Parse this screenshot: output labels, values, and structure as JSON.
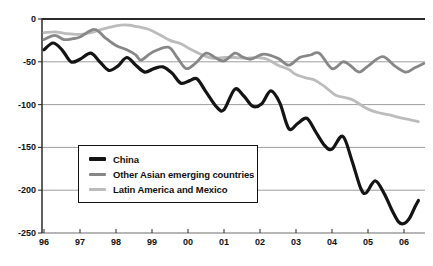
{
  "figure": {
    "background": "#ffffff"
  },
  "chart_data": {
    "type": "line",
    "title": "",
    "xlabel": "",
    "ylabel": "",
    "grid": "horizontal",
    "x_axis": {
      "tick_labels": [
        "96",
        "97",
        "98",
        "99",
        "00",
        "01",
        "02",
        "03",
        "04",
        "05",
        "06"
      ],
      "tick_values": [
        1996,
        1997,
        1998,
        1999,
        2000,
        2001,
        2002,
        2003,
        2004,
        2005,
        2006
      ],
      "range": [
        1996,
        2006.6
      ]
    },
    "y_axis": {
      "tick_labels": [
        "0",
        "-50",
        "-100",
        "-150",
        "-200",
        "-250"
      ],
      "tick_values": [
        0,
        -50,
        -100,
        -150,
        -200,
        -250
      ],
      "range": [
        -250,
        0
      ]
    },
    "legend": {
      "position": "inside-left-middle",
      "border": true
    },
    "colors": {
      "gridline": "#9e9e9e",
      "zero_line": "#2b2b2b",
      "axis": "#2b2b2b",
      "bottom_axis": "#6e6e6e",
      "tick_text": "#111111"
    },
    "series": [
      {
        "name": "China",
        "color": "#141414",
        "stroke_width": 3.2,
        "points": [
          [
            1996.0,
            -36
          ],
          [
            1996.25,
            -28
          ],
          [
            1996.5,
            -36
          ],
          [
            1996.75,
            -50
          ],
          [
            1997.0,
            -47
          ],
          [
            1997.3,
            -40
          ],
          [
            1997.55,
            -50
          ],
          [
            1997.8,
            -60
          ],
          [
            1998.05,
            -55
          ],
          [
            1998.3,
            -45
          ],
          [
            1998.55,
            -54
          ],
          [
            1998.8,
            -62
          ],
          [
            1999.05,
            -58
          ],
          [
            1999.3,
            -56
          ],
          [
            1999.55,
            -63
          ],
          [
            1999.8,
            -75
          ],
          [
            2000.05,
            -72
          ],
          [
            2000.25,
            -70
          ],
          [
            2000.5,
            -85
          ],
          [
            2000.8,
            -103
          ],
          [
            2001.0,
            -106
          ],
          [
            2001.3,
            -82
          ],
          [
            2001.55,
            -90
          ],
          [
            2001.8,
            -102
          ],
          [
            2002.05,
            -99
          ],
          [
            2002.3,
            -84
          ],
          [
            2002.55,
            -98
          ],
          [
            2002.8,
            -128
          ],
          [
            2003.05,
            -122
          ],
          [
            2003.3,
            -116
          ],
          [
            2003.55,
            -132
          ],
          [
            2003.8,
            -148
          ],
          [
            2004.0,
            -152
          ],
          [
            2004.3,
            -137
          ],
          [
            2004.55,
            -165
          ],
          [
            2004.8,
            -198
          ],
          [
            2004.95,
            -203
          ],
          [
            2005.2,
            -189
          ],
          [
            2005.45,
            -204
          ],
          [
            2005.65,
            -222
          ],
          [
            2005.85,
            -237
          ],
          [
            2006.0,
            -239
          ],
          [
            2006.15,
            -233
          ],
          [
            2006.3,
            -220
          ],
          [
            2006.4,
            -212
          ]
        ]
      },
      {
        "name": "Other Asian emerging countries",
        "color": "#878787",
        "stroke_width": 2.8,
        "points": [
          [
            1996.0,
            -24
          ],
          [
            1996.3,
            -19
          ],
          [
            1996.55,
            -24
          ],
          [
            1996.8,
            -23
          ],
          [
            1997.0,
            -21
          ],
          [
            1997.4,
            -12
          ],
          [
            1997.7,
            -22
          ],
          [
            1998.0,
            -31
          ],
          [
            1998.3,
            -36
          ],
          [
            1998.55,
            -42
          ],
          [
            1998.7,
            -48
          ],
          [
            1999.0,
            -39
          ],
          [
            1999.45,
            -33
          ],
          [
            1999.7,
            -45
          ],
          [
            1999.95,
            -58
          ],
          [
            2000.2,
            -52
          ],
          [
            2000.5,
            -40
          ],
          [
            2000.75,
            -45
          ],
          [
            2001.0,
            -49
          ],
          [
            2001.3,
            -40
          ],
          [
            2001.5,
            -44
          ],
          [
            2001.75,
            -47
          ],
          [
            2002.1,
            -41
          ],
          [
            2002.5,
            -46
          ],
          [
            2002.8,
            -54
          ],
          [
            2003.1,
            -45
          ],
          [
            2003.4,
            -42
          ],
          [
            2003.65,
            -40
          ],
          [
            2004.0,
            -58
          ],
          [
            2004.3,
            -50
          ],
          [
            2004.5,
            -54
          ],
          [
            2004.75,
            -62
          ],
          [
            2005.0,
            -55
          ],
          [
            2005.4,
            -44
          ],
          [
            2005.75,
            -55
          ],
          [
            2006.05,
            -62
          ],
          [
            2006.3,
            -57
          ],
          [
            2006.55,
            -52
          ]
        ]
      },
      {
        "name": "Latin America and Mexico",
        "color": "#bcbcbc",
        "stroke_width": 2.8,
        "points": [
          [
            1996.0,
            -16
          ],
          [
            1996.3,
            -15
          ],
          [
            1996.6,
            -17
          ],
          [
            1997.0,
            -18
          ],
          [
            1997.3,
            -16
          ],
          [
            1997.6,
            -12
          ],
          [
            1998.0,
            -8
          ],
          [
            1998.3,
            -7
          ],
          [
            1998.6,
            -9
          ],
          [
            1998.9,
            -12
          ],
          [
            1999.2,
            -18
          ],
          [
            1999.5,
            -25
          ],
          [
            1999.8,
            -29
          ],
          [
            2000.1,
            -36
          ],
          [
            2000.4,
            -42
          ],
          [
            2000.7,
            -46
          ],
          [
            2001.0,
            -45
          ],
          [
            2001.3,
            -45
          ],
          [
            2001.6,
            -46
          ],
          [
            2001.9,
            -45
          ],
          [
            2002.2,
            -47
          ],
          [
            2002.5,
            -54
          ],
          [
            2002.8,
            -59
          ],
          [
            2003.0,
            -65
          ],
          [
            2003.3,
            -69
          ],
          [
            2003.5,
            -71
          ],
          [
            2003.8,
            -79
          ],
          [
            2004.1,
            -89
          ],
          [
            2004.4,
            -92
          ],
          [
            2004.6,
            -95
          ],
          [
            2004.9,
            -103
          ],
          [
            2005.1,
            -107
          ],
          [
            2005.35,
            -110
          ],
          [
            2005.6,
            -112
          ],
          [
            2005.85,
            -115
          ],
          [
            2006.1,
            -117
          ],
          [
            2006.4,
            -120
          ]
        ]
      }
    ]
  }
}
